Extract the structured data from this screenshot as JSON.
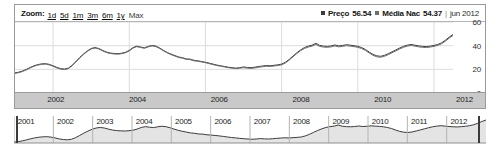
{
  "toolbar": {
    "zoom_label": "Zoom:",
    "ranges": [
      {
        "label": "1d",
        "selected": false
      },
      {
        "label": "5d",
        "selected": false
      },
      {
        "label": "1m",
        "selected": false
      },
      {
        "label": "3m",
        "selected": false
      },
      {
        "label": "6m",
        "selected": false
      },
      {
        "label": "1y",
        "selected": false
      },
      {
        "label": "Max",
        "selected": true
      }
    ],
    "legend": {
      "series1_name": "Preço",
      "series1_value": "56.54",
      "series1_color": "#3c3c3c",
      "series2_name": "Média Nac",
      "series2_value": "54.37",
      "series2_color": "#6e6e6e",
      "separator": "|",
      "date": "jun 2012"
    }
  },
  "chart_data": {
    "type": "line",
    "title": "",
    "xlabel": "",
    "ylabel": "",
    "ylim": [
      0,
      60
    ],
    "yticks": [
      0,
      20,
      40,
      60
    ],
    "xticks": [
      "2002",
      "2004",
      "2006",
      "2008",
      "2010",
      "2012"
    ],
    "grid": true,
    "legend_position": "top-right",
    "x": [
      2001.0,
      2001.1,
      2001.2,
      2001.3,
      2001.4,
      2001.5,
      2001.6,
      2001.7,
      2001.8,
      2001.9,
      2002.0,
      2002.1,
      2002.2,
      2002.3,
      2002.4,
      2002.5,
      2002.6,
      2002.7,
      2002.8,
      2002.9,
      2003.0,
      2003.1,
      2003.2,
      2003.3,
      2003.4,
      2003.5,
      2003.6,
      2003.7,
      2003.8,
      2003.9,
      2004.0,
      2004.1,
      2004.2,
      2004.3,
      2004.4,
      2004.5,
      2004.6,
      2004.7,
      2004.8,
      2004.9,
      2005.0,
      2005.1,
      2005.2,
      2005.3,
      2005.4,
      2005.5,
      2005.6,
      2005.7,
      2005.8,
      2005.9,
      2006.0,
      2006.1,
      2006.2,
      2006.3,
      2006.4,
      2006.5,
      2006.6,
      2006.7,
      2006.8,
      2006.9,
      2007.0,
      2007.1,
      2007.2,
      2007.3,
      2007.4,
      2007.5,
      2007.6,
      2007.7,
      2007.8,
      2007.9,
      2008.0,
      2008.1,
      2008.2,
      2008.3,
      2008.4,
      2008.5,
      2008.6,
      2008.7,
      2008.8,
      2008.9,
      2009.0,
      2009.1,
      2009.2,
      2009.3,
      2009.4,
      2009.5,
      2009.6,
      2009.7,
      2009.8,
      2009.9,
      2010.0,
      2010.1,
      2010.2,
      2010.3,
      2010.4,
      2010.5,
      2010.6,
      2010.7,
      2010.8,
      2010.9,
      2011.0,
      2011.1,
      2011.2,
      2011.3,
      2011.4,
      2011.5,
      2011.6,
      2011.7,
      2011.8,
      2011.9,
      2012.0,
      2012.1,
      2012.2,
      2012.3,
      2012.4,
      2012.5
    ],
    "series": [
      {
        "name": "Preço",
        "color": "#3c3c3c",
        "values": [
          17.0,
          17.6,
          18.6,
          20.0,
          21.6,
          23.0,
          24.0,
          24.6,
          24.8,
          24.2,
          23.0,
          21.6,
          20.6,
          20.2,
          21.0,
          23.4,
          26.6,
          30.0,
          33.0,
          35.6,
          37.6,
          38.4,
          37.6,
          36.0,
          34.6,
          33.8,
          33.4,
          33.2,
          33.6,
          34.4,
          36.0,
          38.4,
          39.6,
          38.8,
          38.2,
          39.4,
          40.2,
          39.6,
          38.0,
          36.0,
          34.2,
          32.8,
          31.6,
          30.4,
          29.8,
          28.8,
          28.6,
          27.6,
          27.2,
          26.6,
          26.0,
          25.2,
          24.4,
          23.6,
          23.0,
          22.4,
          21.8,
          21.4,
          21.0,
          21.4,
          22.0,
          21.6,
          21.4,
          21.8,
          22.4,
          22.8,
          23.2,
          23.0,
          23.4,
          23.8,
          24.4,
          26.0,
          28.4,
          31.2,
          34.0,
          36.4,
          38.4,
          39.6,
          40.4,
          42.0,
          40.2,
          39.6,
          39.4,
          39.8,
          40.6,
          39.8,
          40.2,
          40.8,
          40.4,
          40.0,
          39.4,
          38.4,
          36.8,
          34.6,
          32.6,
          31.4,
          31.0,
          31.8,
          33.2,
          34.8,
          36.4,
          38.0,
          39.4,
          40.4,
          41.0,
          40.4,
          39.8,
          39.4,
          39.2,
          39.6,
          40.2,
          41.0,
          42.4,
          44.6,
          47.2,
          49.4
        ]
      },
      {
        "name": "Média Nac",
        "color": "#6e6e6e",
        "values": [
          16.6,
          17.2,
          18.2,
          19.6,
          21.2,
          22.6,
          23.6,
          24.2,
          24.4,
          23.8,
          22.6,
          21.2,
          20.2,
          19.8,
          20.6,
          23.0,
          26.2,
          29.6,
          32.6,
          35.2,
          37.2,
          38.0,
          37.2,
          35.6,
          34.2,
          33.4,
          33.0,
          32.8,
          33.2,
          34.0,
          35.6,
          38.0,
          39.2,
          38.4,
          37.8,
          39.0,
          39.8,
          39.2,
          37.6,
          35.6,
          33.8,
          32.4,
          31.2,
          30.0,
          29.4,
          28.4,
          28.2,
          27.2,
          26.8,
          26.2,
          25.6,
          24.8,
          24.0,
          23.2,
          22.6,
          22.0,
          21.4,
          21.0,
          20.6,
          21.0,
          21.4,
          21.0,
          20.8,
          21.2,
          21.8,
          22.2,
          22.6,
          22.4,
          22.8,
          23.2,
          23.8,
          25.4,
          27.8,
          30.6,
          33.4,
          35.8,
          37.6,
          38.8,
          39.6,
          41.0,
          39.4,
          38.8,
          38.6,
          39.0,
          39.8,
          39.0,
          39.4,
          40.0,
          39.6,
          39.2,
          38.6,
          37.6,
          36.0,
          33.8,
          31.8,
          30.6,
          30.2,
          31.0,
          32.4,
          34.0,
          35.6,
          37.2,
          38.6,
          39.6,
          40.2,
          39.6,
          39.0,
          38.6,
          38.4,
          38.8,
          39.4,
          40.2,
          41.6,
          43.8,
          46.4,
          48.6
        ]
      }
    ]
  },
  "navigator": {
    "labels": [
      "2001",
      "2002",
      "2003",
      "2004",
      "2005",
      "2006",
      "2007",
      "2008",
      "2009",
      "2010",
      "2011",
      "2012"
    ],
    "selection_start_label": "2001",
    "selection_end_label": "2012",
    "series": {
      "name": "Preço",
      "values": [
        17.0,
        17.6,
        18.6,
        20.0,
        21.6,
        23.0,
        24.0,
        24.6,
        24.8,
        24.2,
        23.0,
        21.6,
        20.6,
        20.2,
        21.0,
        23.4,
        26.6,
        30.0,
        33.0,
        35.6,
        37.6,
        38.4,
        37.6,
        36.0,
        34.6,
        33.8,
        33.4,
        33.2,
        33.6,
        34.4,
        36.0,
        38.4,
        39.6,
        38.8,
        38.2,
        39.4,
        40.2,
        39.6,
        38.0,
        36.0,
        34.2,
        32.8,
        31.6,
        30.4,
        29.8,
        28.8,
        28.6,
        27.6,
        27.2,
        26.6,
        26.0,
        25.2,
        24.4,
        23.6,
        23.0,
        22.4,
        21.8,
        21.4,
        21.0,
        21.4,
        22.0,
        21.6,
        21.4,
        21.8,
        22.4,
        22.8,
        23.2,
        23.0,
        23.4,
        23.8,
        24.4,
        26.0,
        28.4,
        31.2,
        34.0,
        36.4,
        38.4,
        39.6,
        40.4,
        42.0,
        40.2,
        39.6,
        39.4,
        39.8,
        40.6,
        39.8,
        40.2,
        40.8,
        40.4,
        40.0,
        39.4,
        38.4,
        36.8,
        34.6,
        32.6,
        31.4,
        31.0,
        31.8,
        33.2,
        34.8,
        36.4,
        38.0,
        39.4,
        40.4,
        41.0,
        40.4,
        39.8,
        39.4,
        39.2,
        39.6,
        40.2,
        41.0,
        42.4,
        44.6,
        47.2,
        49.4
      ]
    }
  }
}
